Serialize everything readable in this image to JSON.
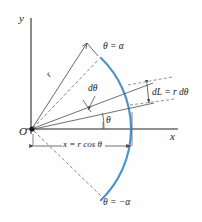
{
  "figure": {
    "name": "polar-arc-differential-length-diagram",
    "background_color": "#fefefe",
    "axis_color": "#5a5a5a",
    "line_color": "#4d4d4d",
    "arc_color": "#4a93c9",
    "text_color": "#1a1a1a"
  },
  "axes": {
    "y_label": "y",
    "x_label": "x",
    "origin_label": "O"
  },
  "labels": {
    "theta_alpha": "θ = α",
    "theta_minus_alpha": "θ = −α",
    "d_theta": "dθ",
    "theta": "θ",
    "dL_expression": "dL = r dθ",
    "radius": "r",
    "x_expression": "x = r cos θ"
  },
  "geometry": {
    "origin": {
      "x": 32,
      "y": 129
    },
    "radius_px": 99,
    "alpha_deg": 46,
    "theta_deg": 14,
    "d_theta_deg": 9,
    "arc_top": {
      "x": 100,
      "y": 58
    },
    "arc_right": {
      "x": 133,
      "y": 129
    },
    "arc_bottom": {
      "x": 100,
      "y": 196
    },
    "x_dimension": {
      "from_x": 33,
      "to_x": 133,
      "y": 146
    }
  }
}
